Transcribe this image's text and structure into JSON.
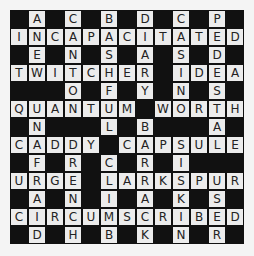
{
  "puzzle": {
    "rows": 13,
    "cols": 13,
    "colors": {
      "block": "#111111",
      "cell": "#ececec",
      "letter": "#222222"
    },
    "grid": [
      "#A#C#B#D#C#P#",
      "INCAPACITATED",
      "#E#N#S#A#S#D#",
      "TWITCHER#IDEA",
      "###O#F#Y#N#S#",
      "QUANTUM#WORTH",
      "#N###L#B###A#",
      "CADDY#CAPSULE",
      "#F#R#C#R#I###",
      "URGE#LARKSPUR",
      "#A#N#I#A#K#S#",
      "CIRCUMSCRIBED",
      "#D#H#B#K#N#R#"
    ]
  }
}
